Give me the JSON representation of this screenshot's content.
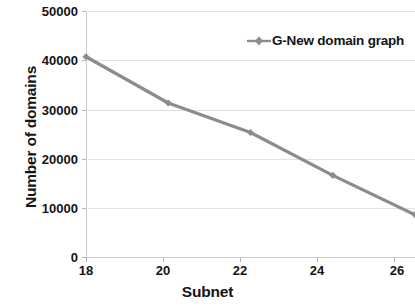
{
  "chart_data": {
    "type": "line",
    "title": "",
    "xlabel": "Subnet",
    "ylabel": "Number of domains",
    "x": [
      18,
      20,
      22,
      24,
      26
    ],
    "xticklabels": [
      "18",
      "20",
      "22",
      "24",
      "26"
    ],
    "xlim": [
      18,
      26
    ],
    "ylim": [
      0,
      50000
    ],
    "yticks": [
      0,
      10000,
      20000,
      30000,
      40000,
      50000
    ],
    "yticklabels": [
      "0",
      "10000",
      "20000",
      "30000",
      "40000",
      "50000"
    ],
    "grid": "horizontal",
    "legend_position": "top-right",
    "series": [
      {
        "name": "G-New domain graph",
        "color": "#8c8c8c",
        "marker": "diamond",
        "values": [
          40700,
          31300,
          25300,
          16600,
          8600
        ]
      }
    ]
  },
  "legend": {
    "entries": [
      {
        "label": "G-New domain graph",
        "color": "#8c8c8c"
      }
    ]
  },
  "axes": {
    "y_title": "Number of domains",
    "x_title": "Subnet",
    "y_labels": [
      "50000",
      "40000",
      "30000",
      "20000",
      "10000",
      "0"
    ],
    "x_labels": [
      "18",
      "20",
      "22",
      "24",
      "26"
    ]
  },
  "colors": {
    "series": "#8c8c8c",
    "gridline": "#e2e2e2",
    "text": "#141414",
    "background": "#ffffff"
  }
}
